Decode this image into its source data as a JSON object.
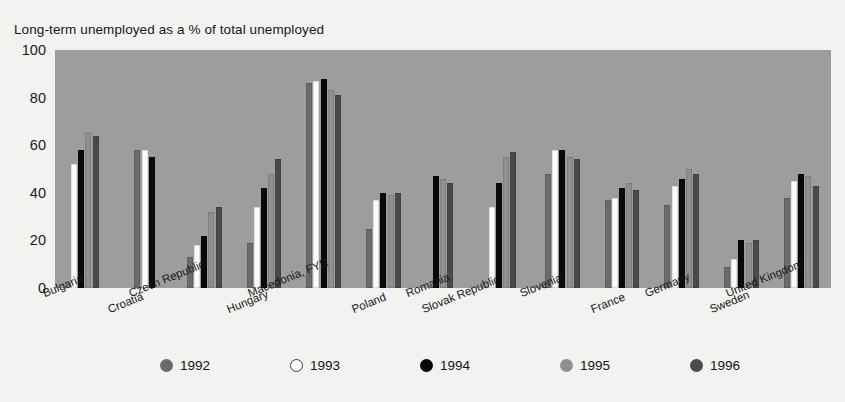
{
  "chart_data": {
    "type": "bar",
    "title": "Long-term unemployed as a % of total unemployed",
    "xlabel": "",
    "ylabel": "",
    "ylim": [
      0,
      100
    ],
    "yticks": [
      0,
      20,
      40,
      60,
      80,
      100
    ],
    "grid": false,
    "legend_position": "bottom",
    "categories": [
      "Bulgaria",
      "Croatia",
      "Czech Republic",
      "Hungary",
      "Macedonia, FYR",
      "Poland",
      "Romania",
      "Slovak Republic",
      "Slovenia",
      "France",
      "Germany",
      "Sweden",
      "United Kingdom"
    ],
    "series": [
      {
        "name": "1992",
        "color": "#6b6b6b",
        "values": [
          null,
          58,
          13,
          19,
          86,
          25,
          null,
          null,
          48,
          37,
          35,
          9,
          38
        ]
      },
      {
        "name": "1993",
        "color": "#fbfbfb",
        "values": [
          52,
          58,
          18,
          34,
          87,
          37,
          null,
          34,
          58,
          38,
          43,
          12,
          45
        ]
      },
      {
        "name": "1994",
        "color": "#0a0a0a",
        "values": [
          58,
          55,
          22,
          42,
          88,
          40,
          47,
          44,
          58,
          42,
          46,
          20,
          48
        ]
      },
      {
        "name": "1995",
        "color": "#8f8f8f",
        "values": [
          65,
          null,
          32,
          48,
          83,
          39,
          46,
          55,
          55,
          44,
          50,
          19,
          47
        ]
      },
      {
        "name": "1996",
        "color": "#4a4a4a",
        "values": [
          64,
          null,
          34,
          54,
          81,
          40,
          44,
          57,
          54,
          41,
          48,
          20,
          43
        ]
      }
    ]
  },
  "legend": {
    "items": [
      {
        "label": "1992",
        "color": "#6b6b6b"
      },
      {
        "label": "1993",
        "color": "#fbfbfb"
      },
      {
        "label": "1994",
        "color": "#0a0a0a"
      },
      {
        "label": "1995",
        "color": "#8f8f8f"
      },
      {
        "label": "1996",
        "color": "#4a4a4a"
      }
    ]
  },
  "source_note": ""
}
